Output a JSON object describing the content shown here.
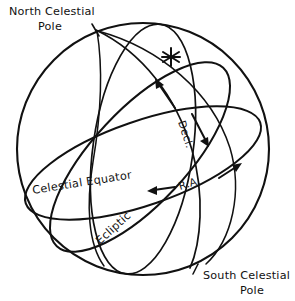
{
  "diagram": {
    "type": "astronomical-schematic",
    "background_color": "#ffffff",
    "ink_color": "#111111"
  },
  "labels": {
    "north_pole_line1": "North Celestial",
    "north_pole_line2": "Pole",
    "south_pole_line1": "South Celestial",
    "south_pole_line2": "Pole",
    "celestial_equator": "Celestial Equator",
    "ecliptic": "Ecliptic",
    "declination": "Decl.",
    "right_ascension": "R.A."
  },
  "markers": {
    "star_symbol": "asterisk-star",
    "star_x": 171,
    "star_y": 57
  },
  "geometry": {
    "sphere_center_x": 143,
    "sphere_center_y": 149,
    "sphere_radius": 126
  }
}
